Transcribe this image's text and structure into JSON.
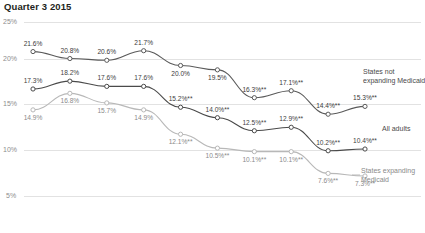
{
  "chart_title": "Quarter 3 2015",
  "axis": {
    "y_ticks": [
      "25%",
      "20%",
      "15%",
      "10%",
      "5%"
    ]
  },
  "legend": {
    "series_not_expanding_line1": "States not",
    "series_not_expanding_line2": "expanding Medicaid",
    "series_all_adults": "All adults",
    "series_expanding_line1": "States expanding",
    "series_expanding_line2": "Medicaid"
  },
  "labels": {
    "not_expanding": [
      "21.6%",
      "20.8%",
      "20.6%",
      "21.7%",
      "20.0%",
      "19.5%",
      "16.3%**",
      "17.1%**",
      "14.4%**",
      "15.3%**"
    ],
    "all_adults": [
      "17.3%",
      "18.2%",
      "17.6%",
      "17.6%",
      "15.2%**",
      "14.0%**",
      "12.5%**",
      "12.9%**",
      "10.2%**",
      "10.4%**"
    ],
    "expanding": [
      "14.9%",
      "16.8%",
      "15.7%",
      "14.9%",
      "12.1%**",
      "10.5%**",
      "10.1%**",
      "10.1%**",
      "7.6%**",
      "7.3%**"
    ]
  },
  "colors": {
    "not_expanding": "#5a5a5a",
    "all_adults": "#4a4a4a",
    "expanding": "#b8b8b8",
    "gridline": "#e2e2e2",
    "axis_text": "#8d8d8d",
    "title": "#231f20"
  },
  "chart_data": {
    "type": "line",
    "title": "Quarter 3 2015",
    "xlabel": "",
    "ylabel": "",
    "ylim": [
      5,
      25
    ],
    "yticks": [
      5,
      10,
      15,
      20,
      25
    ],
    "grid": true,
    "legend_position": "right-inline",
    "x": [
      0,
      1,
      2,
      3,
      4,
      5,
      6,
      7,
      8,
      9
    ],
    "series": [
      {
        "name": "States not expanding Medicaid",
        "color": "#5a5a5a",
        "values": [
          21.6,
          20.8,
          20.6,
          21.7,
          20.0,
          19.5,
          16.3,
          17.1,
          14.4,
          15.3
        ],
        "labels": [
          "21.6%",
          "20.8%",
          "20.6%",
          "21.7%",
          "20.0%",
          "19.5%",
          "16.3%**",
          "17.1%**",
          "14.4%**",
          "15.3%**"
        ]
      },
      {
        "name": "All adults",
        "color": "#4a4a4a",
        "values": [
          17.3,
          18.2,
          17.6,
          17.6,
          15.2,
          14.0,
          12.5,
          12.9,
          10.2,
          10.4
        ],
        "labels": [
          "17.3%",
          "18.2%",
          "17.6%",
          "17.6%",
          "15.2%**",
          "14.0%**",
          "12.5%**",
          "12.9%**",
          "10.2%**",
          "10.4%**"
        ]
      },
      {
        "name": "States expanding Medicaid",
        "color": "#b8b8b8",
        "values": [
          14.9,
          16.8,
          15.7,
          14.9,
          12.1,
          10.5,
          10.1,
          10.1,
          7.6,
          7.3
        ],
        "labels": [
          "14.9%",
          "16.8%",
          "15.7%",
          "14.9%",
          "12.1%**",
          "10.5%**",
          "10.1%**",
          "10.1%**",
          "7.6%**",
          "7.3%**"
        ]
      }
    ]
  }
}
